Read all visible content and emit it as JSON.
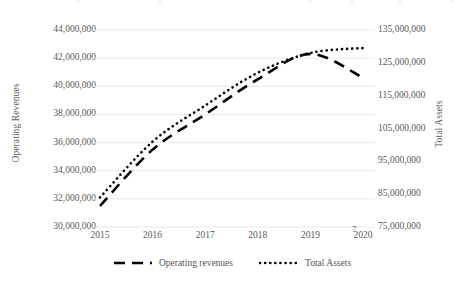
{
  "chart_data": {
    "type": "line",
    "title": "",
    "subtitle": "",
    "xlabel": "",
    "categories": [
      "2015",
      "2016",
      "2017",
      "2018",
      "2019",
      "2020"
    ],
    "grid": true,
    "grid_axis": "y",
    "legend_position": "bottom",
    "series": [
      {
        "name": "Operating revenues",
        "axis": "left",
        "style": "dashed",
        "color": "#000000",
        "values": [
          31500000,
          35500000,
          38000000,
          40500000,
          42300000,
          40600000
        ]
      },
      {
        "name": "Total Assets",
        "axis": "right",
        "style": "dotted",
        "color": "#000000",
        "values": [
          84000000,
          101000000,
          112000000,
          122000000,
          128000000,
          129500000
        ]
      }
    ],
    "axes": {
      "left": {
        "label": "Operating Revenues",
        "min": 30000000,
        "max": 44000000,
        "step": 2000000,
        "ticks": [
          "44,000,000",
          "42,000,000",
          "40,000,000",
          "38,000,000",
          "36,000,000",
          "34,000,000",
          "32,000,000",
          "30,000,000"
        ]
      },
      "right": {
        "label": "Total Assets",
        "min": 75000000,
        "max": 135000000,
        "step": 10000000,
        "ticks": [
          "135,000,000",
          "125,000,000",
          "115,000,000",
          "105,000,000",
          "95,000,000",
          "85,000,000",
          "75,000,000"
        ]
      }
    },
    "legend": [
      {
        "label": "Operating revenues",
        "style": "dashed"
      },
      {
        "label": "Total Assets",
        "style": "dotted"
      }
    ]
  },
  "page_number": "7"
}
